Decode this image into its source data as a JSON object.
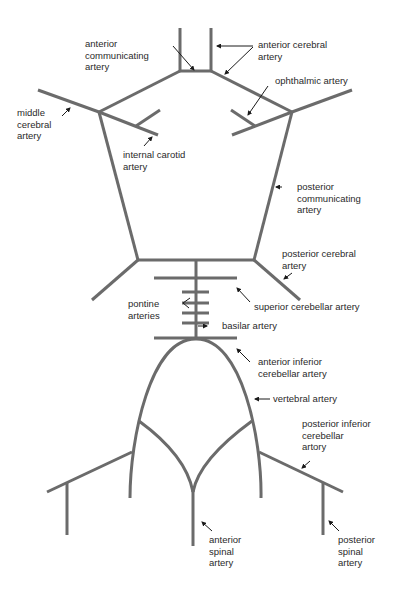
{
  "diagram": {
    "colors": {
      "vessel": "#6b6b6b",
      "pointer": "#1a1a1a",
      "text": "#2a2a2a",
      "background": "#ffffff"
    },
    "labels": {
      "anterior_communicating": "anterior\ncommunicating\nartery",
      "anterior_cerebral": "anterior cerebral\nartery",
      "ophthalmic": "ophthalmic artery",
      "middle_cerebral": "middle\ncerebral\nartery",
      "internal_carotid": "internal carotid\nartery",
      "posterior_communicating": "posterior\ncommunicating\nartery",
      "posterior_cerebral": "posterior cerebral\nartery",
      "superior_cerebellar": "superior cerebellar artery",
      "pontine": "pontine\narteries",
      "basilar": "basilar artery",
      "anterior_inferior_cerebellar": "anterior inferior\ncerebellar artery",
      "vertebral": "vertebral artery",
      "posterior_inferior_cerebellar": "posterior inferior\ncerebellar\nartory",
      "anterior_spinal": "anterior\nspinal\nartery",
      "posterior_spinal": "posterior\nspinal\nartery"
    }
  }
}
